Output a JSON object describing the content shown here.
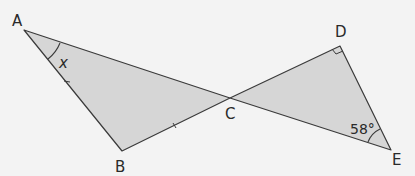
{
  "diagram": {
    "type": "geometry",
    "points": {
      "A": {
        "label": "A"
      },
      "B": {
        "label": "B"
      },
      "C": {
        "label": "C"
      },
      "D": {
        "label": "D"
      },
      "E": {
        "label": "E"
      }
    },
    "angle_labels": {
      "at_A": "x",
      "at_E": "58°"
    },
    "marks": {
      "right_angle_at": "D",
      "equal_sides": [
        "AB",
        "BC"
      ]
    },
    "colors": {
      "fill": "#d6d6d6",
      "stroke": "#3a3a3a",
      "background": "#f3f3f3"
    }
  }
}
